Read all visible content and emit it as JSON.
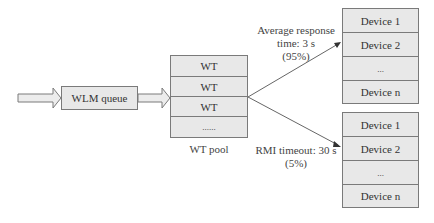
{
  "diagram": {
    "wlm_queue": {
      "label": "WLM queue"
    },
    "wt_pool": {
      "label": "WT pool",
      "cells": [
        "WT",
        "WT",
        "WT",
        "......"
      ]
    },
    "device_group_top": {
      "cells": [
        "Device 1",
        "Device 2",
        "...",
        "Device n"
      ]
    },
    "device_group_bottom": {
      "cells": [
        "Device 1",
        "Device 2",
        "...",
        "Device n"
      ]
    },
    "edge_top_label": {
      "line1": "Average response",
      "line2": "time: 3 s",
      "line3": "(95%)"
    },
    "edge_bottom_label": {
      "line1": "RMI timeout: 30 s",
      "line2": "(5%)"
    },
    "colors": {
      "box_fill": "#e8e8e8",
      "border": "#7a7a7a",
      "line": "#666666",
      "text": "#333333"
    }
  }
}
